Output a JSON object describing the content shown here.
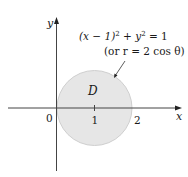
{
  "diagram": {
    "region_label": "D",
    "equation": "(x − 1)² + y² = 1",
    "equation_parts": {
      "lhs_a": "(x − 1)",
      "sup1": "2",
      "plus": " + y",
      "sup2": "2",
      "rhs": " = 1"
    },
    "polar_form": "(or r = 2 cos θ)",
    "x_axis_label": "x",
    "y_axis_label": "y",
    "ticks": {
      "origin": "0",
      "one": "1",
      "two": "2"
    },
    "colors": {
      "disk_fill": "#e6e6e6",
      "disk_stroke": "#c8c8c8",
      "axis": "#333333"
    }
  }
}
